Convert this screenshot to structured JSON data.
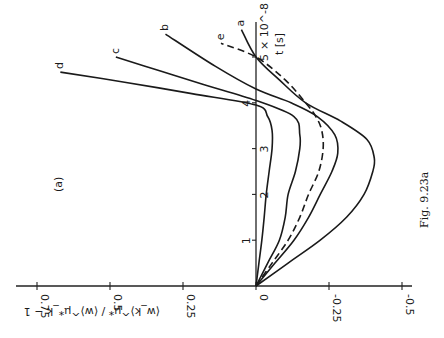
{
  "figure": {
    "caption": "Fig. 9.23a",
    "panel_label": "(a)",
    "rotation_deg": -90
  },
  "chart_data": {
    "type": "line",
    "title": "",
    "panel": "(a)",
    "caption": "Fig. 9.23a",
    "xlabel": "t [s]",
    "x_scale_note": "× 10^-8",
    "ylabel": "⟨w_k⟩^μ* / ⟨w⟩^μ*_k − 1",
    "xlim": [
      0,
      5.6
    ],
    "ylim": [
      -0.5,
      0.75
    ],
    "x_ticks": [
      0,
      1,
      2,
      3,
      4,
      5
    ],
    "y_ticks": [
      0.75,
      0.5,
      0.25,
      0,
      -0.25,
      -0.5
    ],
    "y_tick_labels": [
      "0.75",
      "0.5",
      "0.25",
      "0",
      "-0.25",
      "-0.5"
    ],
    "x_tick_labels": [
      "0",
      "1",
      "2",
      "3",
      "4",
      "5"
    ],
    "grid": false,
    "legend": "curves labelled inline a, b, c, d, e",
    "series": [
      {
        "name": "a",
        "style": "solid",
        "x": [
          0,
          0.5,
          1,
          1.5,
          2,
          2.5,
          2.8,
          3.2,
          3.6,
          4.0,
          4.5,
          5.0,
          5.6
        ],
        "y": [
          0,
          -0.11,
          -0.22,
          -0.31,
          -0.37,
          -0.4,
          -0.405,
          -0.38,
          -0.29,
          -0.17,
          -0.08,
          0,
          0.05
        ]
      },
      {
        "name": "b",
        "style": "solid",
        "x": [
          0,
          0.5,
          1,
          1.5,
          2,
          2.5,
          2.9,
          3.3,
          3.7,
          4.0,
          4.3,
          4.8,
          5.5
        ],
        "y": [
          0,
          -0.065,
          -0.13,
          -0.18,
          -0.22,
          -0.26,
          -0.28,
          -0.27,
          -0.21,
          -0.12,
          0,
          0.14,
          0.31
        ]
      },
      {
        "name": "c",
        "style": "solid",
        "x": [
          0,
          0.5,
          1,
          1.5,
          2,
          2.5,
          3.0,
          3.3,
          3.7,
          4.05,
          4.4,
          4.7,
          5.0
        ],
        "y": [
          0,
          -0.04,
          -0.08,
          -0.1,
          -0.11,
          -0.135,
          -0.15,
          -0.15,
          -0.13,
          0,
          0.18,
          0.33,
          0.48
        ]
      },
      {
        "name": "d",
        "style": "solid",
        "x": [
          0,
          0.5,
          1,
          1.5,
          2,
          2.5,
          3.0,
          3.4,
          3.7,
          3.95,
          4.2,
          4.45,
          4.67
        ],
        "y": [
          0,
          -0.01,
          -0.02,
          -0.028,
          -0.035,
          -0.045,
          -0.055,
          -0.055,
          -0.04,
          0,
          0.22,
          0.45,
          0.67
        ]
      },
      {
        "name": "e",
        "style": "dashed",
        "x": [
          0,
          0.5,
          1,
          1.5,
          2,
          2.5,
          3.0,
          3.4,
          3.7,
          4.0,
          4.5,
          5.0,
          5.3
        ],
        "y": [
          0,
          -0.055,
          -0.11,
          -0.15,
          -0.18,
          -0.215,
          -0.23,
          -0.225,
          -0.205,
          -0.17,
          -0.1,
          0,
          0.12
        ]
      }
    ]
  }
}
